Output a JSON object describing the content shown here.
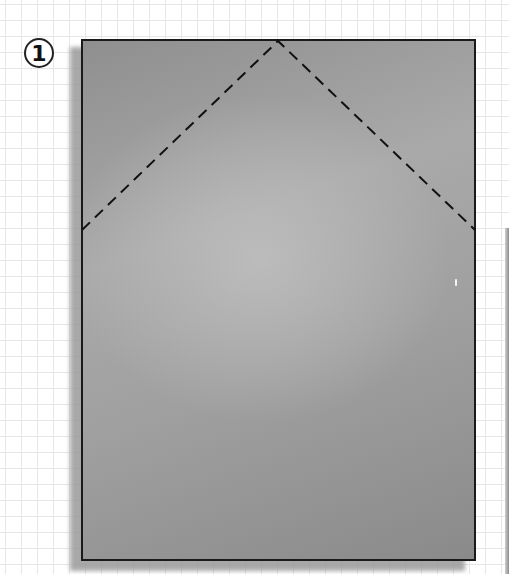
{
  "diagram": {
    "step_number": "1",
    "sheet": {
      "color": "#a0a0a0",
      "border_color": "#1a1a1a",
      "shape": "rectangle"
    },
    "fold_lines": {
      "style": "dashed",
      "color": "#111111",
      "points": [
        [
          82,
          230
        ],
        [
          278,
          41
        ],
        [
          475,
          230
        ]
      ]
    },
    "background": {
      "type": "grid",
      "grid_color": "#e6e6e6",
      "grid_spacing_px": 16
    }
  }
}
